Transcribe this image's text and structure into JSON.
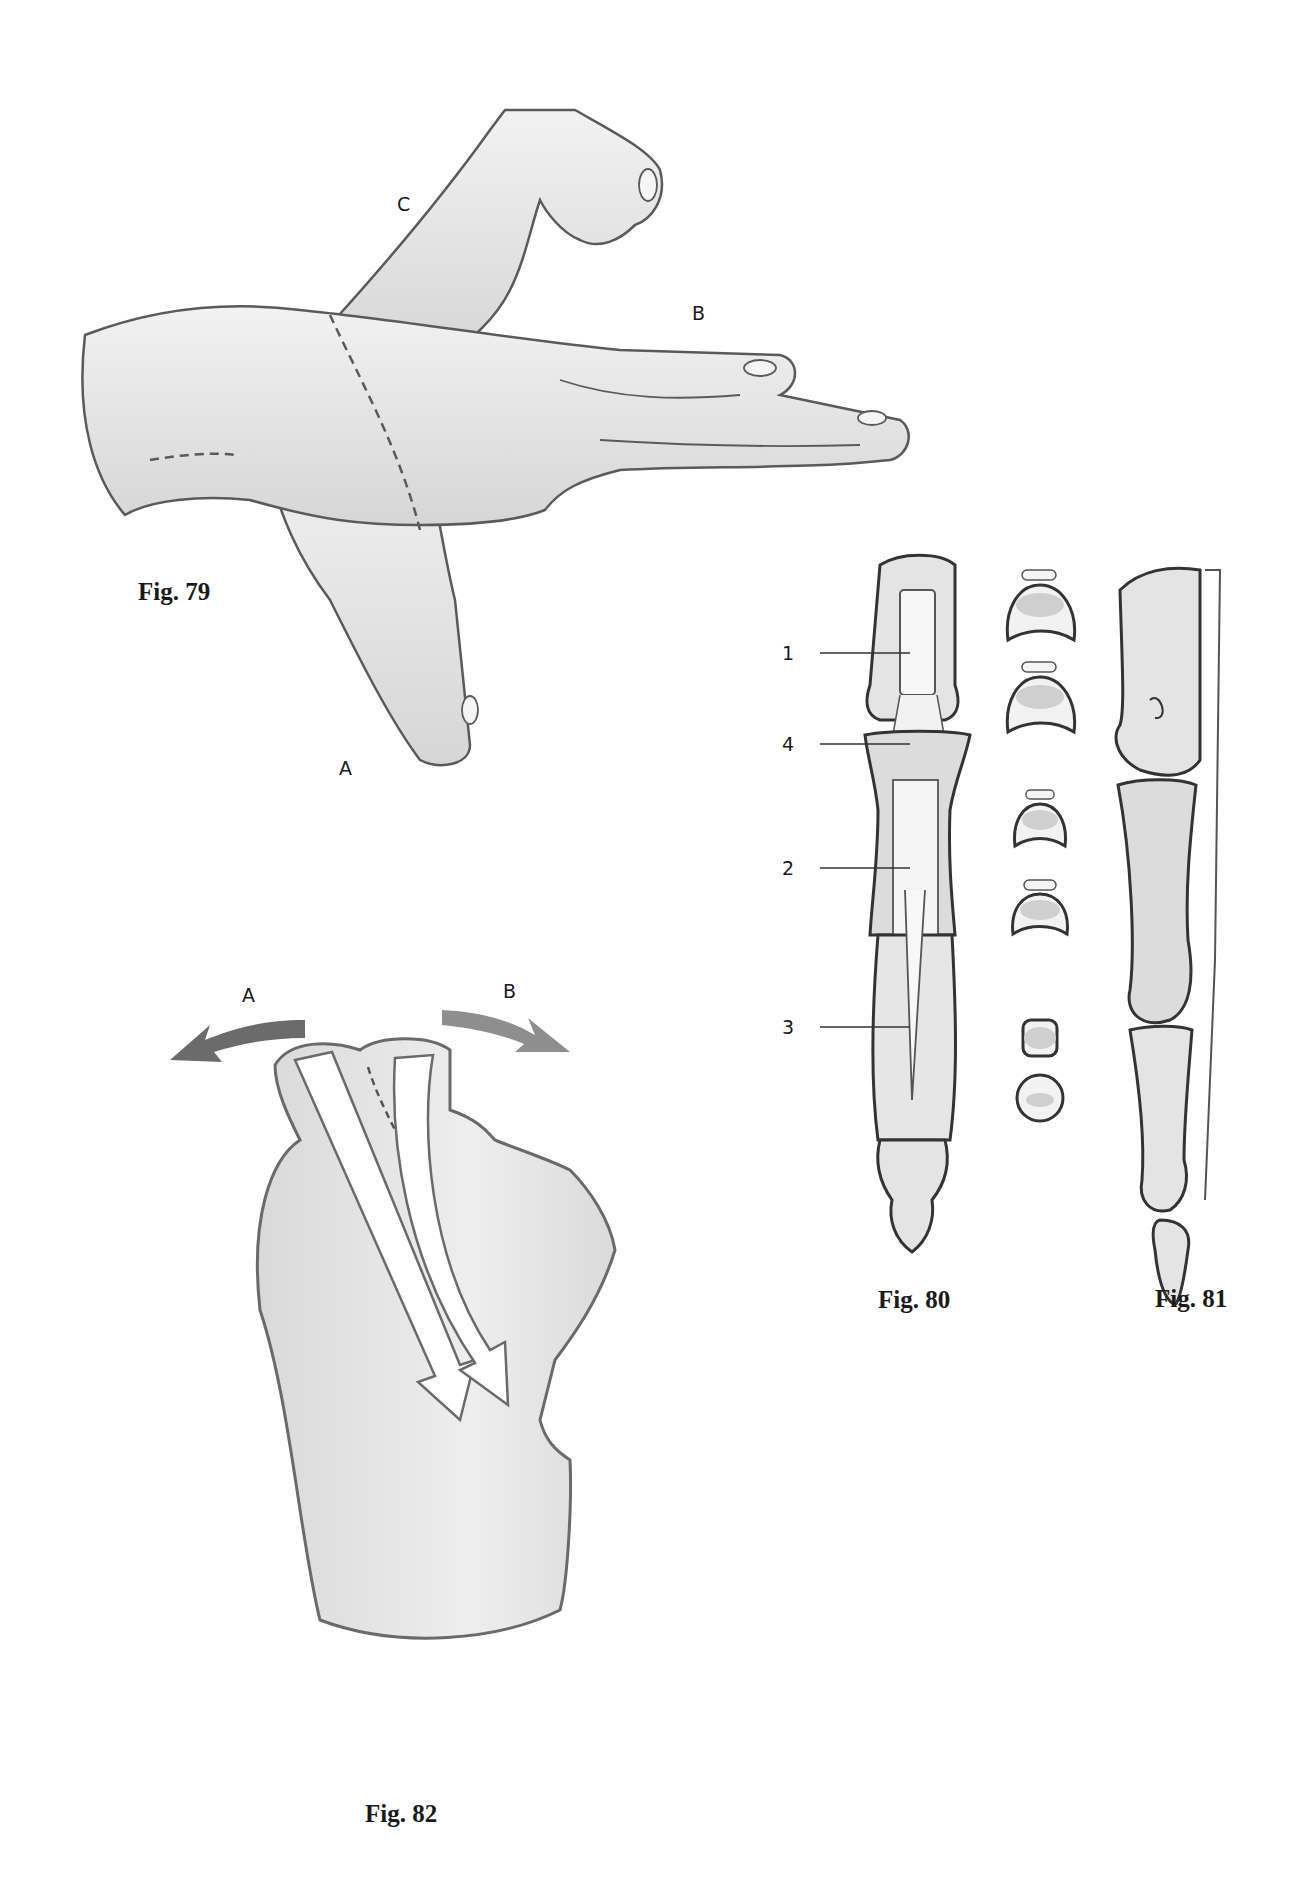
{
  "page": {
    "background": "#ffffff",
    "line_color": "#5a5a5a",
    "fill_color": "#e4e4e4",
    "bone_shade": "#cfcfcf"
  },
  "figures": [
    {
      "id": "fig79",
      "caption": "Fig. 79",
      "subject": "hand positions at wrist",
      "labels": {
        "a": "A",
        "b": "B",
        "c": "C"
      }
    },
    {
      "id": "fig80",
      "caption": "Fig. 80",
      "subject": "finger dorsal view with cross-sections",
      "callouts": [
        {
          "number": "1"
        },
        {
          "number": "4"
        },
        {
          "number": "2"
        },
        {
          "number": "3"
        }
      ],
      "cross_sections": 6
    },
    {
      "id": "fig81",
      "caption": "Fig. 81",
      "subject": "finger lateral view"
    },
    {
      "id": "fig82",
      "caption": "Fig. 82",
      "subject": "fist with directional arrows",
      "labels": {
        "a": "A",
        "b": "B"
      },
      "arrow_colors": {
        "a": "#6b6b6b",
        "b": "#8e8e8e"
      }
    }
  ]
}
